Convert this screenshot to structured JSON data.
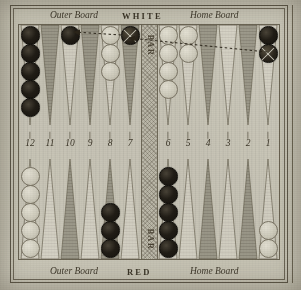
{
  "board": {
    "top_labels": {
      "outer": "Outer Board",
      "player": "WHITE",
      "home": "Home Board"
    },
    "bottom_labels": {
      "outer": "Outer Board",
      "player": "RED",
      "home": "Home Board"
    },
    "bar_label_top": "BAR",
    "bar_label_bottom": "BAR",
    "point_numbers_left": [
      "12",
      "11",
      "10",
      "9",
      "8",
      "7"
    ],
    "point_numbers_right": [
      "6",
      "5",
      "4",
      "3",
      "2",
      "1"
    ],
    "tick_glyph": "❘"
  },
  "colors": {
    "paper": "#c8c5b6",
    "board": "#cbc8ba",
    "ink": "#3a3427",
    "point_dark": "#9d9a8b",
    "point_light": "#d5d2c5",
    "checker_black": "#211d16",
    "checker_white": "#d8d5c7",
    "bar": "#bfbcad",
    "frame": "#5d5748"
  },
  "chart_data": {
    "type": "table",
    "points": [
      {
        "id": "t12",
        "number": "12",
        "row": "top",
        "half": "outer",
        "triangle": "light",
        "checkers": 5,
        "color": "black",
        "marked": 0
      },
      {
        "id": "t11",
        "number": "11",
        "row": "top",
        "half": "outer",
        "triangle": "dark",
        "checkers": 0,
        "color": "",
        "marked": 0
      },
      {
        "id": "t10",
        "number": "10",
        "row": "top",
        "half": "outer",
        "triangle": "light",
        "checkers": 1,
        "color": "black",
        "marked": 0
      },
      {
        "id": "t9",
        "number": "9",
        "row": "top",
        "half": "outer",
        "triangle": "dark",
        "checkers": 0,
        "color": "",
        "marked": 0
      },
      {
        "id": "t8",
        "number": "8",
        "row": "top",
        "half": "outer",
        "triangle": "light",
        "checkers": 3,
        "color": "white",
        "marked": 0
      },
      {
        "id": "t7",
        "number": "7",
        "row": "top",
        "half": "outer",
        "triangle": "dark",
        "checkers": 1,
        "color": "black",
        "marked": 1
      },
      {
        "id": "t6",
        "number": "6",
        "row": "top",
        "half": "home",
        "triangle": "light",
        "checkers": 4,
        "color": "white",
        "marked": 0
      },
      {
        "id": "t5",
        "number": "5",
        "row": "top",
        "half": "home",
        "triangle": "light",
        "checkers": 2,
        "color": "white",
        "marked": 0
      },
      {
        "id": "t4",
        "number": "4",
        "row": "top",
        "half": "home",
        "triangle": "dark",
        "checkers": 0,
        "color": "",
        "marked": 0
      },
      {
        "id": "t3",
        "number": "3",
        "row": "top",
        "half": "home",
        "triangle": "light",
        "checkers": 0,
        "color": "",
        "marked": 0
      },
      {
        "id": "t2",
        "number": "2",
        "row": "top",
        "half": "home",
        "triangle": "dark",
        "checkers": 0,
        "color": "",
        "marked": 0
      },
      {
        "id": "t1",
        "number": "1",
        "row": "top",
        "half": "home",
        "triangle": "light",
        "checkers": 2,
        "color": "black",
        "marked": 1
      },
      {
        "id": "b13",
        "number": "13",
        "row": "bottom",
        "half": "outer",
        "triangle": "light",
        "checkers": 5,
        "color": "white",
        "marked": 0
      },
      {
        "id": "b14",
        "number": "14",
        "row": "bottom",
        "half": "outer",
        "triangle": "light",
        "checkers": 0,
        "color": "",
        "marked": 0
      },
      {
        "id": "b15",
        "number": "15",
        "row": "bottom",
        "half": "outer",
        "triangle": "dark",
        "checkers": 0,
        "color": "",
        "marked": 0
      },
      {
        "id": "b16",
        "number": "16",
        "row": "bottom",
        "half": "outer",
        "triangle": "light",
        "checkers": 0,
        "color": "",
        "marked": 0
      },
      {
        "id": "b17",
        "number": "17",
        "row": "bottom",
        "half": "outer",
        "triangle": "dark",
        "checkers": 3,
        "color": "black",
        "marked": 0
      },
      {
        "id": "b18",
        "number": "18",
        "row": "bottom",
        "half": "outer",
        "triangle": "light",
        "checkers": 0,
        "color": "",
        "marked": 0
      },
      {
        "id": "b19",
        "number": "19",
        "row": "bottom",
        "half": "home",
        "triangle": "light",
        "checkers": 5,
        "color": "black",
        "marked": 0
      },
      {
        "id": "b20",
        "number": "20",
        "row": "bottom",
        "half": "home",
        "triangle": "light",
        "checkers": 0,
        "color": "",
        "marked": 0
      },
      {
        "id": "b21",
        "number": "21",
        "row": "bottom",
        "half": "home",
        "triangle": "dark",
        "checkers": 0,
        "color": "",
        "marked": 0
      },
      {
        "id": "b22",
        "number": "22",
        "row": "bottom",
        "half": "home",
        "triangle": "light",
        "checkers": 0,
        "color": "",
        "marked": 0
      },
      {
        "id": "b23",
        "number": "23",
        "row": "bottom",
        "half": "home",
        "triangle": "dark",
        "checkers": 0,
        "color": "",
        "marked": 0
      },
      {
        "id": "b24",
        "number": "24",
        "row": "bottom",
        "half": "home",
        "triangle": "light",
        "checkers": 2,
        "color": "white",
        "marked": 0
      }
    ],
    "moves": [
      {
        "id": "move-7-to-10",
        "from_point": "7",
        "to_point": "10",
        "label": ""
      },
      {
        "id": "move-1-to-7",
        "from_point": "1",
        "to_point": "7",
        "label": ""
      }
    ]
  }
}
